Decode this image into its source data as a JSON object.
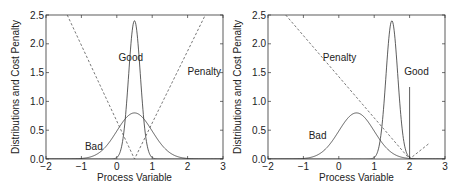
{
  "chart_data": [
    {
      "type": "line",
      "title": "",
      "xlabel": "Process Variable",
      "ylabel": "Distributions and Cost Penalty",
      "xlim": [
        -2,
        3
      ],
      "ylim": [
        0,
        2.5
      ],
      "xticks": [
        "-2",
        "-1",
        "0",
        "1",
        "2",
        "3"
      ],
      "yticks": [
        "0.0",
        "0.5",
        "1.0",
        "1.5",
        "2.0",
        "2.5"
      ],
      "grid": false,
      "series": [
        {
          "name": "Good",
          "style": "solid",
          "kind": "normal",
          "mean": 0.5,
          "peak": 2.4,
          "sd": 0.166
        },
        {
          "name": "Bad",
          "style": "solid",
          "kind": "normal",
          "mean": 0.5,
          "peak": 0.8,
          "sd": 0.5
        },
        {
          "name": "Penalty",
          "style": "dashed",
          "kind": "piecewise-linear",
          "x": [
            -1.4,
            0.5,
            2.5
          ],
          "y": [
            2.5,
            0.0,
            2.5
          ]
        }
      ],
      "annotations": [
        {
          "text": "Good",
          "x": 0.05,
          "y": 1.7
        },
        {
          "text": "Penalty",
          "x": 2.0,
          "y": 1.45
        },
        {
          "text": "Bad",
          "x": -0.9,
          "y": 0.15
        }
      ]
    },
    {
      "type": "line",
      "title": "",
      "xlabel": "Process Variable",
      "ylabel": "Distributions and Cost Penalty",
      "xlim": [
        -2,
        3
      ],
      "ylim": [
        0,
        2.5
      ],
      "xticks": [
        "-2",
        "-1",
        "0",
        "1",
        "2",
        "3"
      ],
      "yticks": [
        "0.0",
        "0.5",
        "1.0",
        "1.5",
        "2.0",
        "2.5"
      ],
      "grid": false,
      "series": [
        {
          "name": "Good",
          "style": "solid",
          "kind": "normal",
          "mean": 1.5,
          "peak": 2.4,
          "sd": 0.166
        },
        {
          "name": "Bad",
          "style": "solid",
          "kind": "normal",
          "mean": 0.5,
          "peak": 0.8,
          "sd": 0.5
        },
        {
          "name": "Penalty",
          "style": "dashed",
          "kind": "piecewise-linear",
          "x": [
            -1.5,
            2.0,
            2.55
          ],
          "y": [
            2.5,
            0.0,
            0.27
          ]
        },
        {
          "name": "Spec limit",
          "style": "solid",
          "kind": "vline",
          "x": 2.0,
          "y": [
            0,
            1.25
          ]
        }
      ],
      "annotations": [
        {
          "text": "Penalty",
          "x": -0.45,
          "y": 1.7
        },
        {
          "text": "Good",
          "x": 1.85,
          "y": 1.45
        },
        {
          "text": "Bad",
          "x": -0.85,
          "y": 0.35
        }
      ]
    }
  ]
}
